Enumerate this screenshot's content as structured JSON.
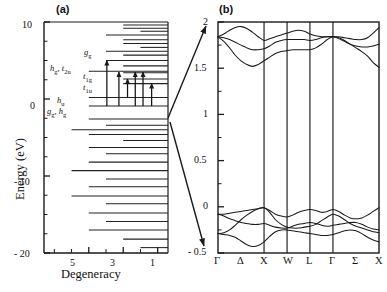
{
  "figure": {
    "panel_a_tag": "(a)",
    "panel_b_tag": "(b)"
  },
  "panel_a": {
    "ylabel": "Energy (eV)",
    "xlabel": "Degeneracy",
    "ytick_labels": [
      "10",
      "0",
      "- 10",
      "- 20"
    ],
    "xtick_labels": [
      "5",
      "3",
      "1"
    ],
    "orbital_labels": [
      {
        "text": "g",
        "sub": "g"
      },
      {
        "text": "h",
        "sub": "g"
      },
      {
        "text": "t",
        "sub": "2u"
      },
      {
        "text": "t",
        "sub": "1g"
      },
      {
        "text": "t",
        "sub": "1u"
      },
      {
        "text": "h",
        "sub": "u"
      },
      {
        "text": "g",
        "sub": "g"
      },
      {
        "text": "h",
        "sub": "g"
      }
    ]
  },
  "panel_b": {
    "ytick_labels": [
      "2",
      "1.5",
      "1",
      "0.5",
      "0",
      "- 0.5"
    ],
    "kpoint_labels": [
      "Γ",
      "Δ",
      "X",
      "W",
      "L",
      "Γ",
      "Σ",
      "X"
    ]
  },
  "chart_data": [
    {
      "type": "scatter",
      "title": "(a) Molecular orbital energy levels",
      "xlabel": "Degeneracy",
      "ylabel": "Energy (eV)",
      "xlim": [
        7.6,
        0.4
      ],
      "ylim": [
        -20,
        10
      ],
      "yticks": [
        10,
        0,
        -10,
        -20
      ],
      "xticks": [
        7,
        6,
        5,
        4,
        3,
        2,
        1
      ],
      "xticklabels": {
        "5": "5",
        "3": "3",
        "1": "1"
      },
      "grid": false,
      "legend": null,
      "note": "Horizontal bars: each level drawn as a line whose left end starts at its degeneracy value and extends right to the axis edge.",
      "levels": [
        {
          "energy": 9.6,
          "degeneracy": 3
        },
        {
          "energy": 9.2,
          "degeneracy": 3
        },
        {
          "energy": 8.8,
          "degeneracy": 2
        },
        {
          "energy": 8.3,
          "degeneracy": 4
        },
        {
          "energy": 7.7,
          "degeneracy": 3
        },
        {
          "energy": 7.2,
          "degeneracy": 3
        },
        {
          "energy": 6.7,
          "degeneracy": 2
        },
        {
          "energy": 6.2,
          "degeneracy": 4
        },
        {
          "energy": 5.7,
          "degeneracy": 3
        },
        {
          "energy": 5.0,
          "degeneracy": 4,
          "label": "g_g"
        },
        {
          "energy": 4.3,
          "degeneracy": 3
        },
        {
          "energy": 3.6,
          "degeneracy": 5,
          "label": "h_g"
        },
        {
          "energy": 3.4,
          "degeneracy": 3,
          "label": "t_2u"
        },
        {
          "energy": 2.6,
          "degeneracy": 3,
          "label": "t_1g"
        },
        {
          "energy": 2.0,
          "degeneracy": 3,
          "label": "t_1u"
        },
        {
          "energy": 0.2,
          "degeneracy": 5,
          "label": "h_u"
        },
        {
          "energy": -0.9,
          "degeneracy": 5,
          "label": "g_g, h_g"
        },
        {
          "energy": -2.6,
          "degeneracy": 5
        },
        {
          "energy": -3.4,
          "degeneracy": 4
        },
        {
          "energy": -4.0,
          "degeneracy": 6
        },
        {
          "energy": -4.6,
          "degeneracy": 5
        },
        {
          "energy": -5.4,
          "degeneracy": 3
        },
        {
          "energy": -6.3,
          "degeneracy": 5
        },
        {
          "energy": -7.1,
          "degeneracy": 4
        },
        {
          "energy": -8.2,
          "degeneracy": 5
        },
        {
          "energy": -9.3,
          "degeneracy": 6
        },
        {
          "energy": -10.4,
          "degeneracy": 4
        },
        {
          "energy": -11.4,
          "degeneracy": 5
        },
        {
          "energy": -12.6,
          "degeneracy": 6
        },
        {
          "energy": -13.6,
          "degeneracy": 4
        },
        {
          "energy": -14.8,
          "degeneracy": 5
        },
        {
          "energy": -15.9,
          "degeneracy": 4
        },
        {
          "energy": -17.0,
          "degeneracy": 5
        },
        {
          "energy": -18.2,
          "degeneracy": 3
        },
        {
          "energy": -19.3,
          "degeneracy": 2
        }
      ],
      "transition_arrows": [
        {
          "degeneracy": 3.95,
          "from": -0.9,
          "to": 5.0
        },
        {
          "degeneracy": 3.25,
          "from": -0.9,
          "to": 3.5
        },
        {
          "degeneracy": 2.75,
          "from": 0.2,
          "to": 2.6
        },
        {
          "degeneracy": 2.3,
          "from": -0.9,
          "to": 3.5
        },
        {
          "degeneracy": 1.85,
          "from": -0.9,
          "to": 3.5
        },
        {
          "degeneracy": 1.35,
          "from": -0.9,
          "to": 2.0
        }
      ]
    },
    {
      "type": "line",
      "title": "(b) Electronic band structure",
      "xlabel": "",
      "ylabel": "",
      "ylim": [
        -0.5,
        2
      ],
      "yticks": [
        2,
        1.5,
        1,
        0.5,
        0,
        -0.5
      ],
      "grid": false,
      "legend": null,
      "kpath": [
        "Γ",
        "Δ",
        "X",
        "W",
        "L",
        "Γ",
        "Σ",
        "X"
      ],
      "kpath_x": [
        0,
        0.143,
        0.286,
        0.429,
        0.571,
        0.714,
        0.857,
        1.0
      ],
      "vertical_lines_at": [
        "X",
        "W",
        "L",
        "Γ"
      ],
      "note": "Upper manifold (conduction, ~1.45-2.0 eV) and lower manifold (valence, ~-0.45 to 0.02 eV) separated by a gap.",
      "series": [
        {
          "name": "c1",
          "x": [
            0.0,
            0.036,
            0.072,
            0.107,
            0.143,
            0.179,
            0.214,
            0.25,
            0.286,
            0.321,
            0.357,
            0.393,
            0.429,
            0.464,
            0.5,
            0.536,
            0.571,
            0.607,
            0.643,
            0.679,
            0.714,
            0.75,
            0.786,
            0.821,
            0.857,
            0.893,
            0.929,
            0.964,
            1.0
          ],
          "values": [
            1.84,
            1.87,
            1.91,
            1.94,
            1.95,
            1.93,
            1.89,
            1.84,
            1.8,
            1.82,
            1.84,
            1.86,
            1.88,
            1.9,
            1.91,
            1.9,
            1.87,
            1.85,
            1.84,
            1.84,
            1.84,
            1.84,
            1.83,
            1.82,
            1.81,
            1.81,
            1.83,
            1.88,
            1.94
          ]
        },
        {
          "name": "c2",
          "x": [
            0.0,
            0.036,
            0.072,
            0.107,
            0.143,
            0.179,
            0.214,
            0.25,
            0.286,
            0.321,
            0.357,
            0.393,
            0.429,
            0.464,
            0.5,
            0.536,
            0.571,
            0.607,
            0.643,
            0.679,
            0.714,
            0.75,
            0.786,
            0.821,
            0.857,
            0.893,
            0.929,
            0.964,
            1.0
          ],
          "values": [
            1.84,
            1.83,
            1.81,
            1.78,
            1.75,
            1.72,
            1.7,
            1.7,
            1.71,
            1.74,
            1.78,
            1.8,
            1.81,
            1.81,
            1.81,
            1.81,
            1.8,
            1.81,
            1.83,
            1.84,
            1.84,
            1.82,
            1.79,
            1.76,
            1.74,
            1.73,
            1.73,
            1.74,
            1.76
          ]
        },
        {
          "name": "c3",
          "x": [
            0.0,
            0.036,
            0.072,
            0.107,
            0.143,
            0.179,
            0.214,
            0.25,
            0.286,
            0.321,
            0.357,
            0.393,
            0.429,
            0.464,
            0.5,
            0.536,
            0.571,
            0.607,
            0.643,
            0.679,
            0.714,
            0.75,
            0.786,
            0.821,
            0.857,
            0.893,
            0.929,
            0.964,
            1.0
          ],
          "values": [
            1.84,
            1.79,
            1.72,
            1.64,
            1.58,
            1.54,
            1.52,
            1.54,
            1.58,
            1.62,
            1.66,
            1.68,
            1.69,
            1.7,
            1.7,
            1.7,
            1.7,
            1.72,
            1.76,
            1.81,
            1.84,
            1.83,
            1.8,
            1.76,
            1.72,
            1.68,
            1.63,
            1.56,
            1.51
          ]
        }
      ],
      "valence_series": [
        {
          "name": "v1",
          "x": [
            0.0,
            0.036,
            0.072,
            0.107,
            0.143,
            0.179,
            0.214,
            0.25,
            0.286,
            0.321,
            0.357,
            0.393,
            0.429,
            0.464,
            0.5,
            0.536,
            0.571,
            0.607,
            0.643,
            0.679,
            0.714,
            0.75,
            0.786,
            0.821,
            0.857,
            0.893,
            0.929,
            0.964,
            1.0
          ],
          "values": [
            -0.08,
            -0.08,
            -0.07,
            -0.06,
            -0.05,
            -0.04,
            -0.03,
            -0.02,
            -0.01,
            -0.04,
            -0.08,
            -0.1,
            -0.11,
            -0.09,
            -0.06,
            -0.04,
            -0.03,
            -0.04,
            -0.06,
            -0.05,
            -0.03,
            -0.05,
            -0.09,
            -0.12,
            -0.13,
            -0.12,
            -0.09,
            -0.05,
            -0.01
          ]
        },
        {
          "name": "v2",
          "x": [
            0.0,
            0.036,
            0.072,
            0.107,
            0.143,
            0.179,
            0.214,
            0.25,
            0.286,
            0.321,
            0.357,
            0.393,
            0.429,
            0.464,
            0.5,
            0.536,
            0.571,
            0.607,
            0.643,
            0.679,
            0.714,
            0.75,
            0.786,
            0.821,
            0.857,
            0.893,
            0.929,
            0.964,
            1.0
          ],
          "values": [
            -0.08,
            -0.1,
            -0.13,
            -0.15,
            -0.17,
            -0.18,
            -0.19,
            -0.19,
            -0.18,
            -0.2,
            -0.22,
            -0.23,
            -0.23,
            -0.21,
            -0.19,
            -0.18,
            -0.17,
            -0.18,
            -0.2,
            -0.21,
            -0.2,
            -0.19,
            -0.18,
            -0.17,
            -0.17,
            -0.19,
            -0.22,
            -0.24,
            -0.25
          ]
        },
        {
          "name": "v3",
          "x": [
            0.0,
            0.036,
            0.072,
            0.107,
            0.143,
            0.179,
            0.214,
            0.25,
            0.286,
            0.321,
            0.357,
            0.393,
            0.429,
            0.464,
            0.5,
            0.536,
            0.571,
            0.607,
            0.643,
            0.679,
            0.714,
            0.75,
            0.786,
            0.821,
            0.857,
            0.893,
            0.929,
            0.964,
            1.0
          ],
          "values": [
            -0.29,
            -0.28,
            -0.25,
            -0.2,
            -0.14,
            -0.09,
            -0.05,
            -0.02,
            -0.01,
            -0.06,
            -0.14,
            -0.19,
            -0.22,
            -0.23,
            -0.23,
            -0.22,
            -0.21,
            -0.19,
            -0.15,
            -0.11,
            -0.08,
            -0.1,
            -0.14,
            -0.18,
            -0.21,
            -0.23,
            -0.25,
            -0.27,
            -0.28
          ]
        },
        {
          "name": "v4",
          "x": [
            0.0,
            0.036,
            0.072,
            0.107,
            0.143,
            0.179,
            0.214,
            0.25,
            0.286,
            0.321,
            0.357,
            0.393,
            0.429,
            0.464,
            0.5,
            0.536,
            0.571,
            0.607,
            0.643,
            0.679,
            0.714,
            0.75,
            0.786,
            0.821,
            0.857,
            0.893,
            0.929,
            0.964,
            1.0
          ],
          "values": [
            -0.29,
            -0.3,
            -0.31,
            -0.33,
            -0.37,
            -0.41,
            -0.43,
            -0.42,
            -0.38,
            -0.32,
            -0.27,
            -0.25,
            -0.25,
            -0.26,
            -0.27,
            -0.28,
            -0.29,
            -0.3,
            -0.31,
            -0.31,
            -0.3,
            -0.28,
            -0.26,
            -0.25,
            -0.26,
            -0.29,
            -0.33,
            -0.36,
            -0.38
          ]
        }
      ]
    }
  ]
}
